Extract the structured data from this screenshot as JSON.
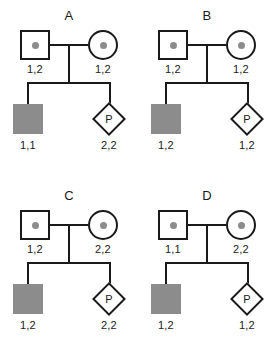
{
  "figure": {
    "title": "",
    "symbol_colors": {
      "outline": "#1a1a1a",
      "affected_fill": "#8c8c8c",
      "carrier_dot": "#8c8c8c",
      "unaffected_fill": "#ffffff",
      "background": "#ffffff"
    },
    "proband_letter": "P"
  },
  "panels": [
    {
      "letter": "A",
      "father": {
        "shape": "square",
        "status": "carrier-dot",
        "genotype": "1,2"
      },
      "mother": {
        "shape": "circle",
        "status": "carrier-dot",
        "genotype": "1,2"
      },
      "child1": {
        "shape": "square",
        "status": "affected-filled",
        "genotype": "1,1"
      },
      "child2": {
        "shape": "diamond",
        "status": "prenatal",
        "label": "P",
        "genotype": "2,2"
      }
    },
    {
      "letter": "B",
      "father": {
        "shape": "square",
        "status": "carrier-dot",
        "genotype": "1,2"
      },
      "mother": {
        "shape": "circle",
        "status": "carrier-dot",
        "genotype": "1,2"
      },
      "child1": {
        "shape": "square",
        "status": "affected-filled",
        "genotype": "1,2"
      },
      "child2": {
        "shape": "diamond",
        "status": "prenatal",
        "label": "P",
        "genotype": "1,2"
      }
    },
    {
      "letter": "C",
      "father": {
        "shape": "square",
        "status": "carrier-dot",
        "genotype": "1,2"
      },
      "mother": {
        "shape": "circle",
        "status": "carrier-dot",
        "genotype": "2,2"
      },
      "child1": {
        "shape": "square",
        "status": "affected-filled",
        "genotype": "1,2"
      },
      "child2": {
        "shape": "diamond",
        "status": "prenatal",
        "label": "P",
        "genotype": "2,2"
      }
    },
    {
      "letter": "D",
      "father": {
        "shape": "square",
        "status": "carrier-dot",
        "genotype": "1,1"
      },
      "mother": {
        "shape": "circle",
        "status": "carrier-dot",
        "genotype": "2,2"
      },
      "child1": {
        "shape": "square",
        "status": "affected-filled",
        "genotype": "1,2"
      },
      "child2": {
        "shape": "diamond",
        "status": "prenatal",
        "label": "P",
        "genotype": "1,2"
      }
    }
  ]
}
